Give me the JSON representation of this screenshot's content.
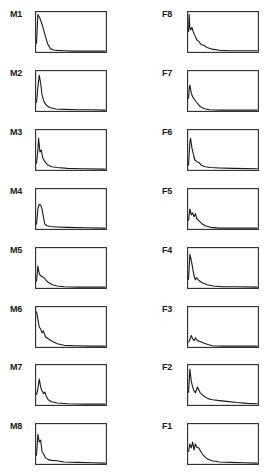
{
  "figure": {
    "left_column_label": "M",
    "right_column_label": "F"
  },
  "colors": {
    "frame": "#2a2a2a",
    "trace": "#1a1a1a",
    "background": "#ffffff"
  },
  "chart_data": {
    "type": "line",
    "note": "Small-multiples of decaying traces; no axes, ticks or units are printed. Values are approximate shape traces, normalized 0-1 on both axes by eye, not readings from a scale.",
    "title": "",
    "xlabel": "",
    "ylabel": "",
    "xlim": [
      0,
      1
    ],
    "ylim": [
      0,
      1
    ],
    "grid": false,
    "legend": "none",
    "panels": [
      {
        "label": "M1",
        "column": "left",
        "row": 0,
        "x": [
          0,
          0.02,
          0.05,
          0.08,
          0.12,
          0.16,
          0.2,
          0.25,
          0.3,
          0.4,
          0.55,
          0.75,
          1.0
        ],
        "y": [
          0.2,
          0.95,
          0.85,
          0.7,
          0.45,
          0.2,
          0.08,
          0.04,
          0.03,
          0.02,
          0.01,
          0.01,
          0.01
        ]
      },
      {
        "label": "M2",
        "column": "left",
        "row": 1,
        "x": [
          0,
          0.02,
          0.04,
          0.06,
          0.08,
          0.11,
          0.15,
          0.2,
          0.28,
          0.4,
          0.6,
          0.8,
          1.0
        ],
        "y": [
          0.2,
          0.6,
          0.9,
          0.7,
          0.4,
          0.22,
          0.12,
          0.07,
          0.04,
          0.03,
          0.02,
          0.02,
          0.01
        ]
      },
      {
        "label": "M3",
        "column": "left",
        "row": 2,
        "x": [
          0,
          0.02,
          0.03,
          0.05,
          0.07,
          0.09,
          0.12,
          0.16,
          0.22,
          0.3,
          0.45,
          0.65,
          1.0
        ],
        "y": [
          0.15,
          0.5,
          0.8,
          0.45,
          0.5,
          0.3,
          0.2,
          0.12,
          0.07,
          0.05,
          0.03,
          0.02,
          0.01
        ]
      },
      {
        "label": "M4",
        "column": "left",
        "row": 3,
        "x": [
          0,
          0.02,
          0.04,
          0.06,
          0.08,
          0.1,
          0.12,
          0.15,
          0.2,
          0.3,
          0.45,
          0.7,
          1.0
        ],
        "y": [
          0.1,
          0.5,
          0.62,
          0.6,
          0.5,
          0.3,
          0.12,
          0.07,
          0.05,
          0.04,
          0.03,
          0.02,
          0.01
        ]
      },
      {
        "label": "M5",
        "column": "left",
        "row": 4,
        "x": [
          0,
          0.02,
          0.04,
          0.06,
          0.08,
          0.11,
          0.14,
          0.18,
          0.23,
          0.3,
          0.4,
          0.6,
          1.0
        ],
        "y": [
          0.15,
          0.55,
          0.35,
          0.3,
          0.28,
          0.25,
          0.18,
          0.12,
          0.07,
          0.04,
          0.02,
          0.01,
          0.01
        ]
      },
      {
        "label": "M6",
        "column": "left",
        "row": 5,
        "x": [
          0,
          0.02,
          0.04,
          0.06,
          0.08,
          0.1,
          0.13,
          0.17,
          0.22,
          0.3,
          0.4,
          0.55,
          0.8,
          1.0
        ],
        "y": [
          0.9,
          0.7,
          0.5,
          0.45,
          0.35,
          0.4,
          0.25,
          0.2,
          0.14,
          0.07,
          0.03,
          0.02,
          0.01,
          0.01
        ]
      },
      {
        "label": "M7",
        "column": "left",
        "row": 6,
        "x": [
          0,
          0.02,
          0.04,
          0.06,
          0.08,
          0.1,
          0.12,
          0.14,
          0.17,
          0.22,
          0.3,
          0.45,
          0.7,
          1.0
        ],
        "y": [
          0.25,
          0.4,
          0.65,
          0.45,
          0.35,
          0.28,
          0.32,
          0.22,
          0.12,
          0.07,
          0.04,
          0.02,
          0.01,
          0.01
        ]
      },
      {
        "label": "M8",
        "column": "left",
        "row": 7,
        "x": [
          0,
          0.02,
          0.04,
          0.06,
          0.08,
          0.1,
          0.13,
          0.17,
          0.22,
          0.3,
          0.4,
          0.6,
          0.8,
          1.0
        ],
        "y": [
          0.2,
          0.75,
          0.55,
          0.6,
          0.3,
          0.25,
          0.15,
          0.1,
          0.08,
          0.07,
          0.04,
          0.03,
          0.02,
          0.01
        ]
      },
      {
        "label": "F8",
        "column": "right",
        "row": 0,
        "x": [
          0,
          0.01,
          0.02,
          0.03,
          0.05,
          0.07,
          0.09,
          0.12,
          0.15,
          0.18,
          0.22,
          0.27,
          0.34,
          0.45,
          0.6,
          0.8,
          1.0
        ],
        "y": [
          0.5,
          0.95,
          0.6,
          0.55,
          0.62,
          0.5,
          0.42,
          0.3,
          0.26,
          0.18,
          0.16,
          0.1,
          0.06,
          0.03,
          0.02,
          0.02,
          0.02
        ]
      },
      {
        "label": "F7",
        "column": "right",
        "row": 1,
        "x": [
          0,
          0.01,
          0.02,
          0.04,
          0.06,
          0.08,
          0.1,
          0.13,
          0.17,
          0.22,
          0.3,
          0.45,
          1.0
        ],
        "y": [
          0.3,
          0.55,
          0.65,
          0.45,
          0.35,
          0.3,
          0.25,
          0.18,
          0.1,
          0.05,
          0.02,
          0.01,
          0.01
        ]
      },
      {
        "label": "F6",
        "column": "right",
        "row": 2,
        "x": [
          0,
          0.02,
          0.03,
          0.05,
          0.07,
          0.09,
          0.12,
          0.15,
          0.19,
          0.24,
          0.32,
          0.45,
          0.65,
          1.0
        ],
        "y": [
          0.1,
          0.7,
          0.8,
          0.55,
          0.4,
          0.25,
          0.2,
          0.18,
          0.1,
          0.07,
          0.05,
          0.04,
          0.03,
          0.02
        ]
      },
      {
        "label": "F5",
        "column": "right",
        "row": 3,
        "x": [
          0,
          0.02,
          0.04,
          0.06,
          0.08,
          0.1,
          0.12,
          0.15,
          0.19,
          0.24,
          0.32,
          0.45,
          0.65,
          1.0
        ],
        "y": [
          0.2,
          0.5,
          0.35,
          0.4,
          0.3,
          0.38,
          0.25,
          0.2,
          0.13,
          0.07,
          0.03,
          0.01,
          0.01,
          0.01
        ]
      },
      {
        "label": "F4",
        "column": "right",
        "row": 4,
        "x": [
          0,
          0.02,
          0.04,
          0.06,
          0.08,
          0.1,
          0.12,
          0.15,
          0.2,
          0.27,
          0.36,
          0.5,
          0.7,
          1.0
        ],
        "y": [
          0.2,
          0.85,
          0.7,
          0.5,
          0.3,
          0.2,
          0.25,
          0.18,
          0.12,
          0.07,
          0.04,
          0.02,
          0.02,
          0.01
        ]
      },
      {
        "label": "F3",
        "column": "right",
        "row": 5,
        "x": [
          0,
          0.02,
          0.04,
          0.06,
          0.08,
          0.1,
          0.13,
          0.17,
          0.22,
          0.28,
          0.35,
          0.5,
          1.0
        ],
        "y": [
          0.1,
          0.18,
          0.28,
          0.2,
          0.15,
          0.22,
          0.15,
          0.13,
          0.09,
          0.05,
          0.02,
          0.01,
          0.01
        ]
      },
      {
        "label": "F2",
        "column": "right",
        "row": 6,
        "x": [
          0,
          0.02,
          0.04,
          0.06,
          0.08,
          0.1,
          0.13,
          0.17,
          0.22,
          0.28,
          0.35,
          0.45,
          0.55,
          0.7,
          0.85,
          1.0
        ],
        "y": [
          0.3,
          0.9,
          0.6,
          0.45,
          0.35,
          0.3,
          0.45,
          0.3,
          0.22,
          0.15,
          0.12,
          0.1,
          0.08,
          0.05,
          0.03,
          0.02
        ]
      },
      {
        "label": "F1",
        "column": "right",
        "row": 7,
        "x": [
          0,
          0.02,
          0.04,
          0.06,
          0.08,
          0.1,
          0.12,
          0.15,
          0.18,
          0.22,
          0.27,
          0.34,
          0.45,
          0.6,
          0.8,
          1.0
        ],
        "y": [
          0.3,
          0.5,
          0.4,
          0.55,
          0.35,
          0.5,
          0.42,
          0.4,
          0.3,
          0.2,
          0.12,
          0.07,
          0.04,
          0.03,
          0.02,
          0.01
        ]
      }
    ]
  }
}
